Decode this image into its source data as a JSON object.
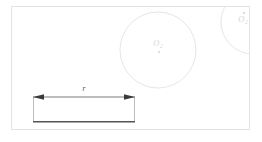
{
  "figure": {
    "background_color": "#ffffff",
    "frame": {
      "name": "outer-border",
      "x": 11,
      "y": 6,
      "width": 239,
      "height": 124,
      "stroke_color": "#e3e3e3",
      "stroke_width": 1
    },
    "circles": [
      {
        "id": "circle-main",
        "label": "O",
        "subscript": "2",
        "has_center_dot": true,
        "center_x": 158,
        "center_y": 50,
        "radius": 38,
        "stroke_color": "#e6e6e6",
        "stroke_width": 1,
        "label_x": 158,
        "label_y": 46,
        "dot_x": 159,
        "dot_y": 52
      },
      {
        "id": "circle-corner",
        "label": "O",
        "subscript": "2",
        "has_center_dot": true,
        "center_x": 253,
        "center_y": 22,
        "radius": 32,
        "stroke_color": "#e6e6e6",
        "stroke_width": 1,
        "label_x": 243,
        "label_y": 22,
        "dot_x": 244,
        "dot_y": 13
      }
    ],
    "bracket": {
      "id": "u-bracket",
      "left_x": 33,
      "right_x": 135,
      "top_y": 97,
      "bottom_y": 122,
      "side_stroke_color": "#bdbdbd",
      "bottom_stroke_color": "#555555",
      "side_stroke_width": 1,
      "bottom_stroke_width": 1.6
    },
    "dimension": {
      "id": "dimension-r",
      "label": "r",
      "line_y": 97,
      "start_x": 33,
      "end_x": 135,
      "stroke_color": "#6e6e6e",
      "stroke_width": 0.9,
      "arrow_color": "#3a3a3a",
      "label_x": 84,
      "label_y": 91
    }
  }
}
